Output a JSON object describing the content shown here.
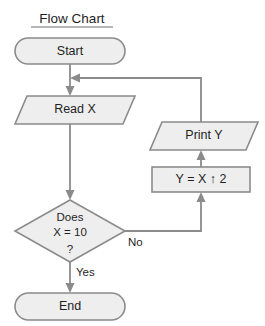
{
  "diagram": {
    "title": "Flow Chart",
    "type": "flowchart",
    "canvas": {
      "width": 265,
      "height": 326
    },
    "colors": {
      "shape_fill": "#eeeeee",
      "shape_stroke": "#8b8b8b",
      "connector": "#8b8b8b",
      "text": "#1f1f1f",
      "background": "#ffffff"
    },
    "nodes": [
      {
        "id": "start",
        "shape": "terminator",
        "label": "Start",
        "lines": [
          "Start"
        ]
      },
      {
        "id": "read-x",
        "shape": "parallelogram",
        "label": "Read X",
        "lines": [
          "Read X"
        ]
      },
      {
        "id": "decision",
        "shape": "diamond",
        "label": "Does X = 10 ?",
        "lines": [
          "Does",
          "X = 10",
          "?"
        ]
      },
      {
        "id": "end",
        "shape": "terminator",
        "label": "End",
        "lines": [
          "End"
        ]
      },
      {
        "id": "print-y",
        "shape": "parallelogram",
        "label": "Print  Y",
        "lines": [
          "Print  Y"
        ]
      },
      {
        "id": "compute-y",
        "shape": "rectangle",
        "label": "Y = X ↑ 2",
        "lines": [
          "Y = X ↑ 2"
        ]
      }
    ],
    "edges": [
      {
        "id": "start-to-read",
        "from": "start",
        "to": "read-x",
        "label": ""
      },
      {
        "id": "read-to-decision",
        "from": "read-x",
        "to": "decision",
        "label": ""
      },
      {
        "id": "decision-no",
        "from": "decision",
        "to": "compute-y",
        "label": "No"
      },
      {
        "id": "decision-yes",
        "from": "decision",
        "to": "end",
        "label": "Yes"
      },
      {
        "id": "compute-to-print",
        "from": "compute-y",
        "to": "print-y",
        "label": ""
      },
      {
        "id": "print-loopback",
        "from": "print-y",
        "to": "read-x",
        "label": ""
      }
    ]
  }
}
